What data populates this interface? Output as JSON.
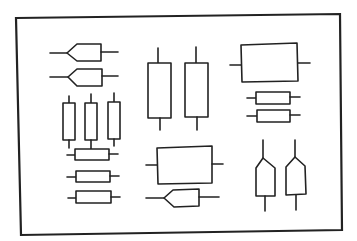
{
  "diagram": {
    "title": "",
    "colors": {
      "line": "#222222",
      "background": "#ffffff"
    },
    "components": [
      {
        "id": "pentagon-left-1",
        "kind": "pentagon",
        "orientation": "horizontal",
        "group": "top-left"
      },
      {
        "id": "pentagon-left-2",
        "kind": "pentagon",
        "orientation": "horizontal",
        "group": "top-left"
      },
      {
        "id": "resistor-vertical-1",
        "kind": "rectangle",
        "orientation": "vertical",
        "group": "left-middle"
      },
      {
        "id": "resistor-vertical-2",
        "kind": "rectangle",
        "orientation": "vertical",
        "group": "left-middle"
      },
      {
        "id": "resistor-vertical-3",
        "kind": "rectangle",
        "orientation": "vertical",
        "group": "left-middle"
      },
      {
        "id": "resistor-horizontal-1",
        "kind": "rectangle",
        "orientation": "horizontal",
        "group": "left-bottom"
      },
      {
        "id": "resistor-horizontal-2",
        "kind": "rectangle",
        "orientation": "horizontal",
        "group": "left-bottom"
      },
      {
        "id": "resistor-horizontal-3",
        "kind": "rectangle",
        "orientation": "horizontal",
        "group": "left-bottom"
      },
      {
        "id": "tall-box-1",
        "kind": "rectangle",
        "orientation": "vertical",
        "group": "center-top"
      },
      {
        "id": "tall-box-2",
        "kind": "rectangle",
        "orientation": "vertical",
        "group": "center-top"
      },
      {
        "id": "large-box-top-right",
        "kind": "rectangle",
        "orientation": "horizontal",
        "group": "right-top"
      },
      {
        "id": "small-resistor-right-1",
        "kind": "rectangle",
        "orientation": "horizontal",
        "group": "right-top"
      },
      {
        "id": "small-resistor-right-2",
        "kind": "rectangle",
        "orientation": "horizontal",
        "group": "right-top"
      },
      {
        "id": "large-box-center-bottom",
        "kind": "rectangle",
        "orientation": "horizontal",
        "group": "center-bottom"
      },
      {
        "id": "pentagon-left-3",
        "kind": "pentagon",
        "orientation": "horizontal",
        "group": "center-bottom"
      },
      {
        "id": "pentagon-up-1",
        "kind": "pentagon",
        "orientation": "vertical",
        "group": "right-bottom"
      },
      {
        "id": "pentagon-up-2",
        "kind": "pentagon",
        "orientation": "vertical",
        "group": "right-bottom"
      }
    ]
  }
}
